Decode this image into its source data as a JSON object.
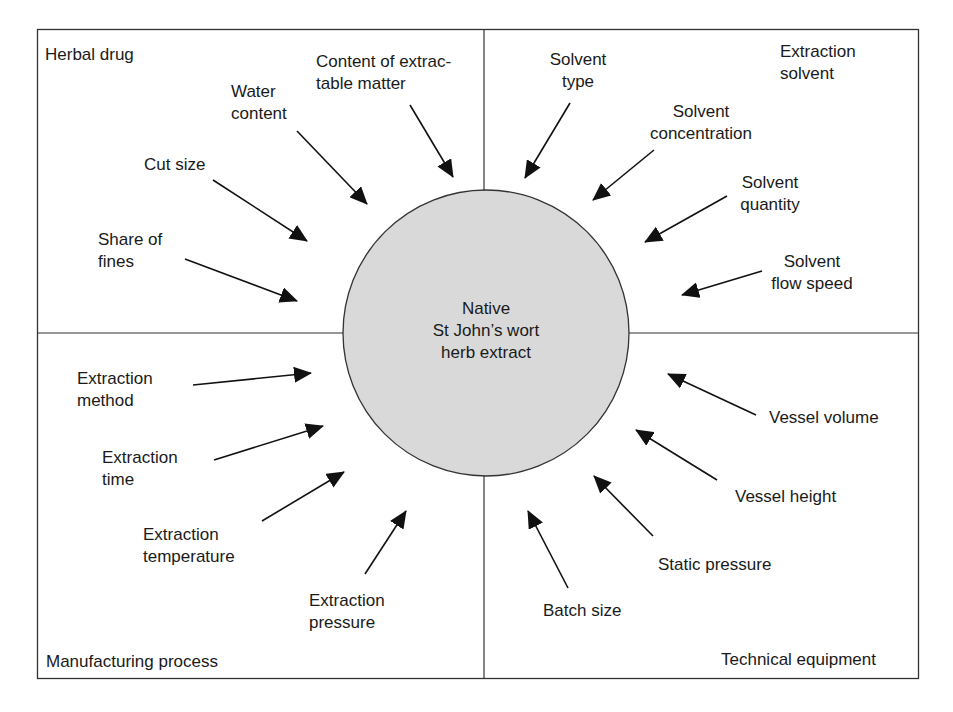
{
  "diagram": {
    "center": {
      "label_lines": [
        "Native",
        "St John’s wort",
        "herb extract"
      ]
    },
    "quadrants": {
      "top_left": {
        "title": "Herbal drug",
        "factors": [
          {
            "lines": [
              "Content of extrac-",
              "table matter"
            ]
          },
          {
            "lines": [
              "Water",
              "content"
            ]
          },
          {
            "lines": [
              "Cut size"
            ]
          },
          {
            "lines": [
              "Share of",
              "fines"
            ]
          }
        ]
      },
      "top_right": {
        "title_lines": [
          "Extraction",
          "solvent"
        ],
        "factors": [
          {
            "lines": [
              "Solvent",
              "type"
            ]
          },
          {
            "lines": [
              "Solvent",
              "concentration"
            ]
          },
          {
            "lines": [
              "Solvent",
              "quantity"
            ]
          },
          {
            "lines": [
              "Solvent",
              "flow speed"
            ]
          }
        ]
      },
      "bottom_left": {
        "title": "Manufacturing process",
        "factors": [
          {
            "lines": [
              "Extraction",
              "method"
            ]
          },
          {
            "lines": [
              "Extraction",
              "time"
            ]
          },
          {
            "lines": [
              "Extraction",
              "temperature"
            ]
          },
          {
            "lines": [
              "Extraction",
              "pressure"
            ]
          }
        ]
      },
      "bottom_right": {
        "title": "Technical equipment",
        "factors": [
          {
            "lines": [
              "Vessel volume"
            ]
          },
          {
            "lines": [
              "Vessel height"
            ]
          },
          {
            "lines": [
              "Static pressure"
            ]
          },
          {
            "lines": [
              "Batch size"
            ]
          }
        ]
      }
    },
    "colors": {
      "circle_fill": "#d9d9d9",
      "line": "#222222",
      "background": "#ffffff"
    }
  }
}
